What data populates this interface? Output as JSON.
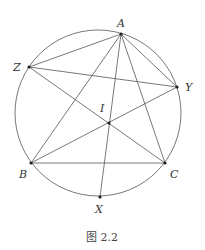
{
  "figure": {
    "caption": "图 2.2",
    "stroke_color": "#555555",
    "circle": {
      "cx": 98,
      "cy": 113,
      "r": 83
    },
    "points": {
      "A": {
        "label": "A",
        "x": 121,
        "y": 34,
        "lx": 117,
        "ly": 27
      },
      "Z": {
        "label": "Z",
        "x": 29,
        "y": 67,
        "lx": 13,
        "ly": 71
      },
      "Y": {
        "label": "Y",
        "x": 177,
        "y": 87,
        "lx": 185,
        "ly": 91
      },
      "I": {
        "label": "I",
        "x": 109,
        "y": 123,
        "lx": 100,
        "ly": 112
      },
      "B": {
        "label": "B",
        "x": 31,
        "y": 163,
        "lx": 19,
        "ly": 178
      },
      "C": {
        "label": "C",
        "x": 165,
        "y": 163,
        "lx": 170,
        "ly": 178
      },
      "X": {
        "label": "X",
        "x": 100,
        "y": 197,
        "lx": 95,
        "ly": 213
      }
    },
    "segments": [
      [
        "A",
        "Z"
      ],
      [
        "A",
        "Y"
      ],
      [
        "Z",
        "Y"
      ],
      [
        "A",
        "B"
      ],
      [
        "A",
        "C"
      ],
      [
        "B",
        "C"
      ],
      [
        "A",
        "X"
      ],
      [
        "Z",
        "C"
      ],
      [
        "Y",
        "B"
      ]
    ]
  }
}
